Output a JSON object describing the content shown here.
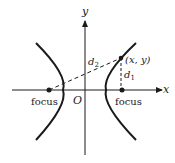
{
  "diagram": {
    "type": "hyperbola",
    "axes": {
      "x_label": "x",
      "y_label": "y",
      "origin_label": "O"
    },
    "foci": [
      {
        "label": "focus",
        "side": "left"
      },
      {
        "label": "focus",
        "side": "right"
      }
    ],
    "point": {
      "label": "(x, y)"
    },
    "distances": [
      {
        "label": "d",
        "subscript": "2",
        "from": "left focus",
        "to": "(x, y)"
      },
      {
        "label": "d",
        "subscript": "1",
        "from": "right focus",
        "to": "(x, y)"
      }
    ],
    "colors": {
      "ink": "#1a1a1a",
      "background": "#ffffff"
    }
  }
}
